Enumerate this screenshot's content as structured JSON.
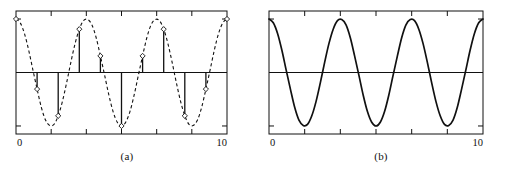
{
  "figure": {
    "background_color": "#ffffff",
    "line_color": "#111111"
  },
  "panels": [
    {
      "id": "panel-a",
      "caption": "(a)",
      "xlabel_left": "0",
      "xlabel_right": "10",
      "curve_style": "dashed",
      "has_stems": true,
      "has_markers": true,
      "marker_shape": "open-diamond"
    },
    {
      "id": "panel-b",
      "caption": "(b)",
      "xlabel_left": "0",
      "xlabel_right": "10",
      "curve_style": "solid",
      "has_stems": false,
      "has_markers": false,
      "marker_shape": "none"
    }
  ],
  "chart_data": [
    {
      "type": "line",
      "title": "(a)",
      "subtitle": "Dashed continuous sinusoid with integer-spaced sample stems",
      "xlabel": "",
      "ylabel": "",
      "xlim": [
        0,
        10
      ],
      "ylim": [
        -1.15,
        1.15
      ],
      "xticks": [
        0,
        10
      ],
      "xtick_labels": [
        "0",
        "10"
      ],
      "xticks_minor": [
        1.667,
        3.333,
        5.0,
        6.667,
        8.333
      ],
      "yticks": [
        -1,
        0,
        1
      ],
      "ytick_labels": [
        "",
        "",
        ""
      ],
      "grid": false,
      "legend": "none",
      "zero_line": true,
      "series": [
        {
          "name": "continuous sinusoid",
          "style": "dashed",
          "formula": "cos(2*pi*0.3*x)",
          "x": [
            0,
            0.2,
            0.4,
            0.6,
            0.8,
            1,
            1.2,
            1.4,
            1.6,
            1.8,
            2,
            2.2,
            2.4,
            2.6,
            2.8,
            3,
            3.2,
            3.4,
            3.6,
            3.8,
            4,
            4.2,
            4.4,
            4.6,
            4.8,
            5,
            5.2,
            5.4,
            5.6,
            5.8,
            6,
            6.2,
            6.4,
            6.6,
            6.8,
            7,
            7.2,
            7.4,
            7.6,
            7.8,
            8,
            8.2,
            8.4,
            8.6,
            8.8,
            9,
            9.2,
            9.4,
            9.6,
            9.8,
            10
          ],
          "y": [
            1.0,
            0.93,
            0.73,
            0.42,
            0.05,
            -0.31,
            -0.65,
            -0.89,
            -0.99,
            -0.97,
            -0.81,
            -0.54,
            -0.19,
            0.19,
            0.54,
            0.81,
            0.97,
            0.99,
            0.89,
            0.65,
            0.31,
            -0.05,
            -0.42,
            -0.73,
            -0.93,
            -1.0,
            -0.93,
            -0.73,
            -0.42,
            -0.05,
            0.31,
            0.65,
            0.89,
            0.99,
            0.97,
            0.81,
            0.54,
            0.19,
            -0.19,
            -0.54,
            -0.81,
            -0.97,
            -0.99,
            -0.89,
            -0.65,
            -0.31,
            0.05,
            0.42,
            0.73,
            0.93,
            1.0
          ]
        },
        {
          "name": "samples (stems)",
          "style": "stem",
          "x": [
            0,
            1,
            2,
            3,
            4,
            5,
            6,
            7,
            8,
            9,
            10
          ],
          "y": [
            1.0,
            -0.31,
            -0.81,
            0.81,
            0.31,
            -1.0,
            0.31,
            0.81,
            -0.81,
            -0.31,
            1.0
          ]
        }
      ]
    },
    {
      "type": "line",
      "title": "(b)",
      "subtitle": "Solid continuous sinusoid (reconstructed)",
      "xlabel": "",
      "ylabel": "",
      "xlim": [
        0,
        10
      ],
      "ylim": [
        -1.15,
        1.15
      ],
      "xticks": [
        0,
        10
      ],
      "xtick_labels": [
        "0",
        "10"
      ],
      "xticks_minor": [
        1.667,
        3.333,
        5.0,
        6.667,
        8.333
      ],
      "yticks": [
        -1,
        0,
        1
      ],
      "ytick_labels": [
        "",
        "",
        ""
      ],
      "grid": false,
      "legend": "none",
      "zero_line": true,
      "series": [
        {
          "name": "continuous sinusoid",
          "style": "solid",
          "formula": "cos(2*pi*0.3*x)",
          "x": [
            0,
            0.2,
            0.4,
            0.6,
            0.8,
            1,
            1.2,
            1.4,
            1.6,
            1.8,
            2,
            2.2,
            2.4,
            2.6,
            2.8,
            3,
            3.2,
            3.4,
            3.6,
            3.8,
            4,
            4.2,
            4.4,
            4.6,
            4.8,
            5,
            5.2,
            5.4,
            5.6,
            5.8,
            6,
            6.2,
            6.4,
            6.6,
            6.8,
            7,
            7.2,
            7.4,
            7.6,
            7.8,
            8,
            8.2,
            8.4,
            8.6,
            8.8,
            9,
            9.2,
            9.4,
            9.6,
            9.8,
            10
          ],
          "y": [
            1.0,
            0.93,
            0.73,
            0.42,
            0.05,
            -0.31,
            -0.65,
            -0.89,
            -0.99,
            -0.97,
            -0.81,
            -0.54,
            -0.19,
            0.19,
            0.54,
            0.81,
            0.97,
            0.99,
            0.89,
            0.65,
            0.31,
            -0.05,
            -0.42,
            -0.73,
            -0.93,
            -1.0,
            -0.93,
            -0.73,
            -0.42,
            -0.05,
            0.31,
            0.65,
            0.89,
            0.99,
            0.97,
            0.81,
            0.54,
            0.19,
            -0.19,
            -0.54,
            -0.81,
            -0.97,
            -0.99,
            -0.89,
            -0.65,
            -0.31,
            0.05,
            0.42,
            0.73,
            0.93,
            1.0
          ]
        }
      ]
    }
  ]
}
